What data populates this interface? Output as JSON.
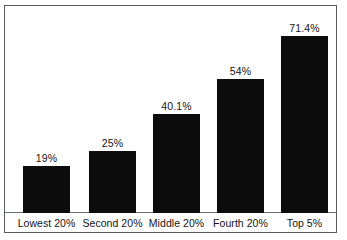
{
  "chart_data": {
    "type": "bar",
    "title": "",
    "subtitle": "",
    "xlabel": "",
    "ylabel": "",
    "categories": [
      "Lowest 20%",
      "Second 20%",
      "Middle 20%",
      "Fourth 20%",
      "Top 5%"
    ],
    "values": [
      19,
      25,
      40.1,
      54,
      71.4
    ],
    "value_labels": [
      "19%",
      "25%",
      "40.1%",
      "54%",
      "71.4%"
    ],
    "ylim": [
      0,
      83.5
    ],
    "grid": false,
    "legend": null,
    "legend_position": "none",
    "axis_tick_labels": [],
    "annotations": [],
    "series": [
      {
        "name": "",
        "values": [
          19,
          25,
          40.1,
          54,
          71.4
        ]
      }
    ],
    "colors": {
      "bar": "#0c0c0c",
      "background": "#ffffff",
      "frame": "#555b5e",
      "axis": "#6a6f72",
      "text": "#141414"
    }
  }
}
